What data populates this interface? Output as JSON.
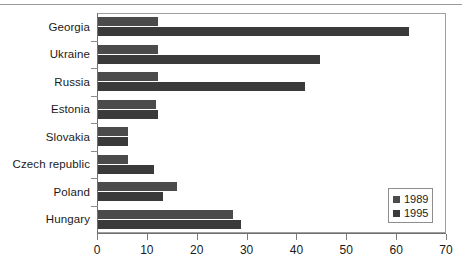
{
  "chart_data": {
    "type": "bar",
    "orientation": "horizontal",
    "title": "",
    "subtitle": "",
    "xlabel": "",
    "ylabel": "",
    "xlim": [
      0,
      70
    ],
    "xticks": [
      0,
      10,
      20,
      30,
      40,
      50,
      60,
      70
    ],
    "grid": false,
    "legend_position": "bottom-right",
    "categories": [
      "Georgia",
      "Ukraine",
      "Russia",
      "Estonia",
      "Slovakia",
      "Czech republic",
      "Poland",
      "Hungary"
    ],
    "series": [
      {
        "name": "1989",
        "color": "#4b4b4b",
        "values": [
          12.0,
          12.0,
          12.0,
          11.7,
          6.0,
          6.0,
          15.8,
          27.0
        ]
      },
      {
        "name": "1995",
        "color": "#3a3a3a",
        "values": [
          62.4,
          44.5,
          41.5,
          12.0,
          6.0,
          11.3,
          13.0,
          28.7
        ]
      }
    ]
  },
  "legend": {
    "entries": [
      {
        "label": "1989",
        "color": "#4b4b4b"
      },
      {
        "label": "1995",
        "color": "#3a3a3a"
      }
    ]
  },
  "axis": {
    "x_tick_labels": [
      "0",
      "10",
      "20",
      "30",
      "40",
      "50",
      "60",
      "70"
    ]
  }
}
